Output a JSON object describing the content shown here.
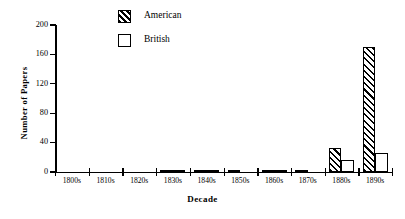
{
  "chart_data": {
    "type": "bar",
    "title": "",
    "xlabel": "Decade",
    "ylabel": "Number of Papers",
    "categories": [
      "1800s",
      "1810s",
      "1820s",
      "1830s",
      "1840s",
      "1850s",
      "1860s",
      "1870s",
      "1880s",
      "1890s"
    ],
    "series": [
      {
        "name": "American",
        "values": [
          0,
          0,
          0,
          2,
          1,
          1,
          1,
          1,
          32,
          170
        ]
      },
      {
        "name": "British",
        "values": [
          0,
          0,
          0,
          1,
          1,
          0,
          1,
          0,
          16,
          26
        ]
      }
    ],
    "ylim": [
      0,
      200
    ],
    "yticks": [
      0,
      40,
      80,
      120,
      160,
      200
    ],
    "ytick_labels": [
      "0",
      "40",
      "80",
      "120",
      "160",
      "200"
    ],
    "grid": false,
    "legend_position": "top-center"
  },
  "legend": {
    "items": [
      {
        "label": "American",
        "pattern": "diagonal-hatch",
        "color": "#000000"
      },
      {
        "label": "British",
        "pattern": "empty",
        "color": "#ffffff"
      }
    ]
  },
  "axes": {
    "x_title": "Decade",
    "y_title": "Number of Papers"
  },
  "colors": {
    "ink": "#000000",
    "background": "#ffffff"
  }
}
